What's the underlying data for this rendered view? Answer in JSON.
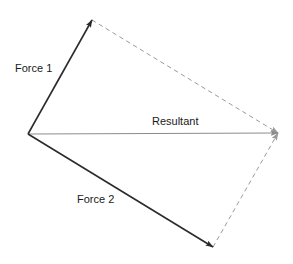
{
  "figure": {
    "background_color": "#ffffff",
    "width": 293,
    "height": 264
  },
  "labels": {
    "force1": "Force 1",
    "force2": "Force 2",
    "resultant": "Resultant"
  },
  "colors": {
    "force_line": "#2b2b2b",
    "resultant_line": "#8c8c8c",
    "dashed_line": "#9a9a9a",
    "text": "#1a1a1a"
  },
  "chart_data": {
    "type": "diagram",
    "origin": {
      "x": 28,
      "y": 134
    },
    "vectors": [
      {
        "name": "Force 1",
        "style": "solid",
        "arrow": "end",
        "from": {
          "x": 28,
          "y": 134
        },
        "to": {
          "x": 92,
          "y": 20
        },
        "label": "Force 1",
        "label_position": {
          "x": 15,
          "y": 69
        },
        "color": "#2b2b2b"
      },
      {
        "name": "Force 2",
        "style": "solid",
        "arrow": "end",
        "from": {
          "x": 28,
          "y": 134
        },
        "to": {
          "x": 213,
          "y": 247
        },
        "label": "Force 2",
        "label_position": {
          "x": 77,
          "y": 200
        },
        "color": "#2b2b2b"
      },
      {
        "name": "Resultant",
        "style": "solid",
        "arrow": "end",
        "from": {
          "x": 28,
          "y": 134
        },
        "to": {
          "x": 278,
          "y": 133
        },
        "label": "Resultant",
        "label_position": {
          "x": 152,
          "y": 122
        },
        "color": "#8c8c8c"
      }
    ],
    "construction_lines": [
      {
        "name": "dashed-from-force1-tip",
        "style": "dashed",
        "from": {
          "x": 92,
          "y": 20
        },
        "to": {
          "x": 278,
          "y": 133
        },
        "color": "#9a9a9a"
      },
      {
        "name": "dashed-from-force2-tip",
        "style": "dashed",
        "from": {
          "x": 213,
          "y": 247
        },
        "to": {
          "x": 278,
          "y": 133
        },
        "color": "#9a9a9a"
      }
    ]
  }
}
